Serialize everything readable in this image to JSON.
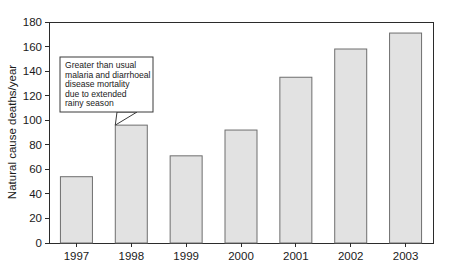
{
  "chart_data": {
    "type": "bar",
    "title": "",
    "subtitle": "",
    "xlabel": "",
    "ylabel": "Natural cause deaths/year",
    "categories": [
      "1997",
      "1998",
      "1999",
      "2000",
      "2001",
      "2002",
      "2003"
    ],
    "values": [
      54,
      96,
      71,
      92,
      135,
      158,
      171
    ],
    "ylim": [
      0,
      180
    ],
    "ytick_step": 20,
    "ytick_labels": [
      "0",
      "20",
      "40",
      "60",
      "80",
      "100",
      "120",
      "140",
      "160",
      "180"
    ],
    "grid": false,
    "legend": null,
    "bar_fill_color": "#e2e2e2",
    "bar_border_color": "#6e6e6e",
    "axis_color": "#2b2b2b",
    "background_color": "#ffffff",
    "annotations": [
      {
        "id": "rainy-season-callout",
        "lines": [
          "Greater than usual",
          "malaria and diarrhoeal",
          "disease mortality",
          "due to extended",
          "rainy season"
        ],
        "points_to_category": "1998"
      }
    ]
  }
}
